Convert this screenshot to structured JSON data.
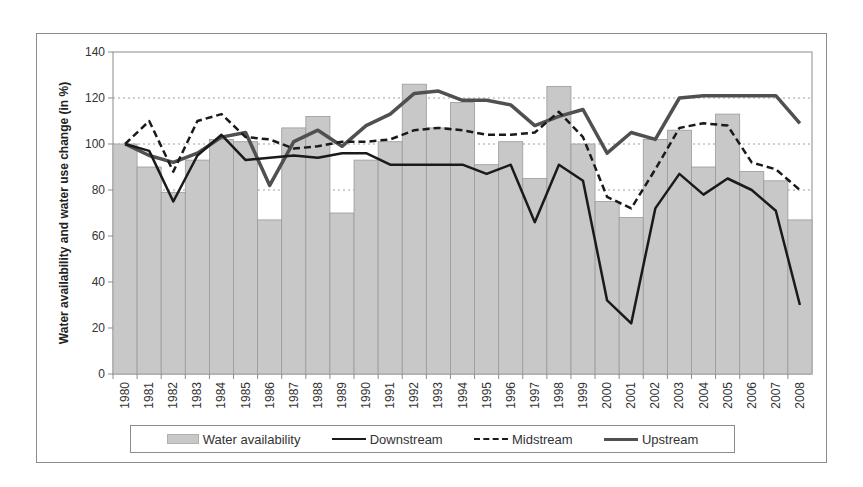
{
  "chart_data": {
    "type": "bar+line",
    "title": "",
    "xlabel": "",
    "ylabel": "Water availability and water use change (in %)",
    "ylim": [
      0,
      140
    ],
    "yticks": [
      0,
      20,
      40,
      60,
      80,
      100,
      120,
      140
    ],
    "grid": "dashed horizontal at 80, 100, 120",
    "legend_position": "bottom",
    "categories": [
      "1980",
      "1981",
      "1982",
      "1983",
      "1984",
      "1985",
      "1986",
      "1987",
      "1988",
      "1989",
      "1990",
      "1991",
      "1992",
      "1993",
      "1994",
      "1995",
      "1996",
      "1997",
      "1998",
      "1999",
      "2000",
      "2001",
      "2002",
      "2003",
      "2004",
      "2005",
      "2006",
      "2007",
      "2008"
    ],
    "series": [
      {
        "name": "Water availability",
        "type": "bar",
        "color": "#c8c8c8",
        "values": [
          100,
          90,
          79,
          93,
          102,
          101,
          67,
          107,
          112,
          70,
          93,
          101,
          126,
          107,
          118,
          91,
          101,
          85,
          125,
          100,
          75,
          68,
          102,
          106,
          90,
          113,
          88,
          84,
          67
        ]
      },
      {
        "name": "Downstream",
        "type": "line",
        "style": "solid",
        "color": "#1a1a1a",
        "values": [
          100,
          97,
          75,
          95,
          104,
          93,
          94,
          95,
          94,
          96,
          96,
          91,
          91,
          91,
          91,
          87,
          91,
          66,
          91,
          84,
          32,
          22,
          72,
          87,
          78,
          85,
          80,
          71,
          30
        ]
      },
      {
        "name": "Midstream",
        "type": "line",
        "style": "dashed",
        "color": "#1a1a1a",
        "values": [
          100,
          110,
          88,
          110,
          113,
          103,
          102,
          98,
          99,
          101,
          101,
          102,
          106,
          107,
          106,
          104,
          104,
          105,
          114,
          103,
          77,
          72,
          89,
          107,
          109,
          108,
          92,
          89,
          80
        ]
      },
      {
        "name": "Upstream",
        "type": "line",
        "style": "solid-thick",
        "color": "#505050",
        "values": [
          100,
          95,
          92,
          96,
          103,
          105,
          82,
          101,
          106,
          99,
          108,
          113,
          122,
          123,
          119,
          119,
          117,
          108,
          112,
          115,
          96,
          105,
          102,
          120,
          121,
          121,
          121,
          121,
          109
        ]
      }
    ]
  },
  "legend": {
    "items": [
      {
        "label": "Water availability"
      },
      {
        "label": "Downstream"
      },
      {
        "label": "Midstream"
      },
      {
        "label": "Upstream"
      }
    ]
  }
}
